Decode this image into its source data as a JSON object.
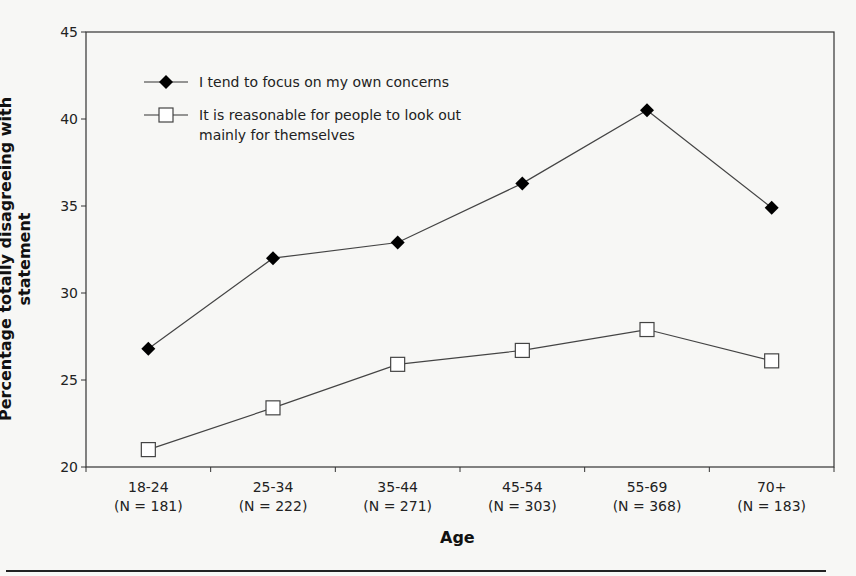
{
  "chart_data": {
    "type": "line",
    "title": "",
    "xlabel": "Age",
    "ylabel": "Percentage totally disagreeing with statement",
    "ylim": [
      20,
      45
    ],
    "yticks": [
      20,
      25,
      30,
      35,
      40,
      45
    ],
    "grid": false,
    "legend_position": "upper-left inside",
    "categories": [
      "18-24",
      "25-34",
      "35-44",
      "45-54",
      "55-69",
      "70+"
    ],
    "category_n": [
      "(N = 181)",
      "(N = 222)",
      "(N = 271)",
      "(N = 303)",
      "(N = 368)",
      "(N = 183)"
    ],
    "series": [
      {
        "name": "I tend to focus on my own concerns",
        "marker": "filled-diamond",
        "values": [
          26.8,
          32.0,
          32.9,
          36.3,
          40.5,
          34.9
        ]
      },
      {
        "name": "It is reasonable for people to look out mainly for themselves",
        "marker": "open-square",
        "values": [
          21.0,
          23.4,
          25.9,
          26.7,
          27.9,
          26.1
        ]
      }
    ]
  },
  "legend": {
    "line1": "I tend to focus on my own concerns",
    "line2a": "It is reasonable for people to look out",
    "line2b": "mainly for themselves"
  },
  "axes": {
    "xlabel": "Age",
    "ylabel": "Percentage totally disagreeing with statement"
  }
}
